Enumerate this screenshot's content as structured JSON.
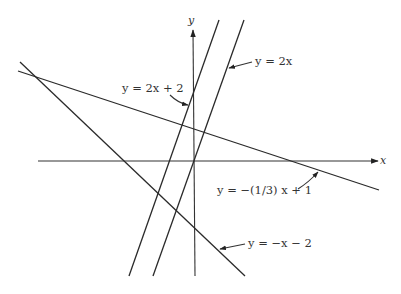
{
  "diagram": {
    "type": "coordinate-plane-lines",
    "axes": {
      "x_label": "x",
      "y_label": "y"
    },
    "lines": [
      {
        "id": "line-2x-plus-2",
        "equation": "y = 2x + 2",
        "slope": 2,
        "intercept": 2
      },
      {
        "id": "line-2x",
        "equation": "y = 2x",
        "slope": 2,
        "intercept": 0
      },
      {
        "id": "line-neg-third-x-plus-1",
        "equation": "y = −(1/3) x + 1",
        "slope": -0.3333,
        "intercept": 1
      },
      {
        "id": "line-neg-x-minus-2",
        "equation": "y = −x − 2",
        "slope": -1,
        "intercept": -2
      }
    ],
    "labels": {
      "l1": "y = 2x + 2",
      "l2": "y = 2x",
      "l3": "y = −(1/3) x + 1",
      "l4": "y = −x − 2"
    },
    "colors": {
      "line": "#2a2a2a",
      "text": "#333333",
      "background": "#ffffff"
    }
  }
}
